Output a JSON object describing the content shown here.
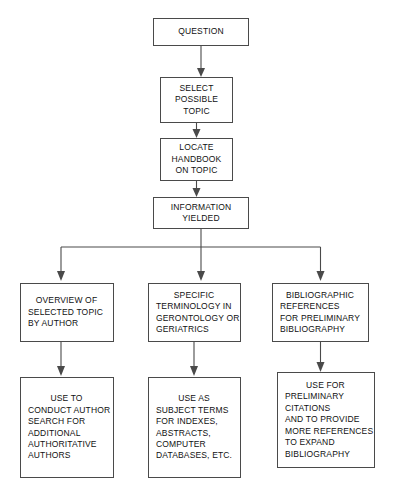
{
  "diagram": {
    "type": "flowchart",
    "stroke_color": "#4a4a4a",
    "text_color": "#111111",
    "background": "#ffffff",
    "nodes": [
      {
        "id": "question",
        "lines": [
          "QUESTION"
        ],
        "x": 153,
        "y": 18,
        "w": 96,
        "h": 28,
        "align": "center"
      },
      {
        "id": "select-possible-topic",
        "lines": [
          "SELECT",
          "POSSIBLE",
          "TOPIC"
        ],
        "x": 160,
        "y": 77,
        "w": 73,
        "h": 46,
        "align": "center"
      },
      {
        "id": "locate-handbook-on-topic",
        "lines": [
          "LOCATE",
          "HANDBOOK",
          "ON TOPIC"
        ],
        "x": 160,
        "y": 138,
        "w": 73,
        "h": 43,
        "align": "center"
      },
      {
        "id": "information-yielded",
        "lines": [
          "INFORMATION",
          "YIELDED"
        ],
        "x": 153,
        "y": 197,
        "w": 96,
        "h": 32,
        "align": "center"
      },
      {
        "id": "overview-of-selected-topic",
        "lines": [
          "OVERVIEW  OF",
          "SELECTED TOPIC",
          "BY AUTHOR"
        ],
        "x": 20,
        "y": 283,
        "w": 94,
        "h": 59,
        "align": "mixed"
      },
      {
        "id": "specific-terminology",
        "lines": [
          "SPECIFIC",
          "TERMINOLOGY IN",
          "GERONTOLOGY OR",
          "GERIATRICS"
        ],
        "x": 148,
        "y": 283,
        "w": 93,
        "h": 59,
        "align": "mixed"
      },
      {
        "id": "bibliographic-references",
        "lines": [
          "BIBLIOGRAPHIC",
          "REFERENCES",
          "FOR PRELIMINARY",
          "BIBLIOGRAPHY"
        ],
        "x": 272,
        "y": 283,
        "w": 97,
        "h": 59,
        "align": "mixed"
      },
      {
        "id": "use-to-conduct-author-search",
        "lines": [
          "USE TO",
          "CONDUCT AUTHOR",
          "SEARCH FOR",
          "ADDITIONAL",
          "AUTHORITATIVE",
          "AUTHORS"
        ],
        "x": 20,
        "y": 377,
        "w": 94,
        "h": 101,
        "align": "mixed"
      },
      {
        "id": "use-as-subject-terms",
        "lines": [
          "USE AS",
          "SUBJECT TERMS",
          "FOR INDEXES,",
          "ABSTRACTS,",
          "COMPUTER",
          "DATABASES, ETC."
        ],
        "x": 148,
        "y": 377,
        "w": 93,
        "h": 101,
        "align": "mixed"
      },
      {
        "id": "use-for-preliminary-citations",
        "lines": [
          "USE FOR",
          "PRELIMINARY",
          "CITATIONS",
          "AND TO PROVIDE",
          "MORE REFERENCES",
          "TO EXPAND",
          "BIBLIOGRAPHY"
        ],
        "x": 277,
        "y": 372,
        "w": 98,
        "h": 96,
        "align": "mixed"
      }
    ],
    "connectors": [
      {
        "id": "question-to-select",
        "from": "question",
        "to": "select-possible-topic",
        "kind": "vertical-arrow"
      },
      {
        "id": "select-to-locate",
        "from": "select-possible-topic",
        "to": "locate-handbook-on-topic",
        "kind": "vertical-arrow"
      },
      {
        "id": "locate-to-information",
        "from": "locate-handbook-on-topic",
        "to": "information-yielded",
        "kind": "vertical-arrow"
      },
      {
        "id": "information-to-branch-bus",
        "from": "information-yielded",
        "to": "branch-bus",
        "kind": "vertical-line"
      },
      {
        "id": "branch-bus",
        "kind": "horizontal-bus",
        "x1": 61,
        "x2": 320,
        "y": 247
      },
      {
        "id": "bus-to-overview",
        "from": "branch-bus",
        "to": "overview-of-selected-topic",
        "kind": "vertical-arrow"
      },
      {
        "id": "bus-to-specific",
        "from": "branch-bus",
        "to": "specific-terminology",
        "kind": "vertical-arrow"
      },
      {
        "id": "bus-to-bibliographic",
        "from": "branch-bus",
        "to": "bibliographic-references",
        "kind": "vertical-arrow"
      },
      {
        "id": "overview-to-use-author",
        "from": "overview-of-selected-topic",
        "to": "use-to-conduct-author-search",
        "kind": "vertical-arrow"
      },
      {
        "id": "specific-to-use-subject",
        "from": "specific-terminology",
        "to": "use-as-subject-terms",
        "kind": "vertical-arrow"
      },
      {
        "id": "bibliographic-to-use-preliminary",
        "from": "bibliographic-references",
        "to": "use-for-preliminary-citations",
        "kind": "vertical-arrow"
      }
    ]
  }
}
